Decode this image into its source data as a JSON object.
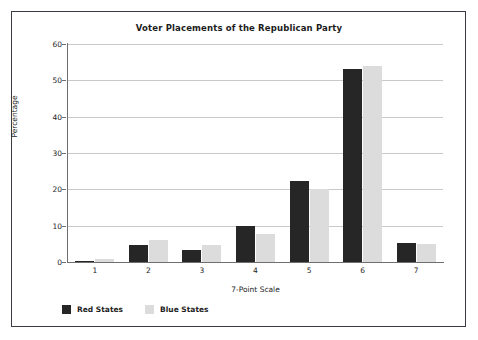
{
  "chart_data": {
    "type": "bar",
    "title": "Voter Placements of the Republican Party",
    "xlabel": "7-Point Scale",
    "ylabel": "Percentage",
    "categories": [
      "1",
      "2",
      "3",
      "4",
      "5",
      "6",
      "7"
    ],
    "series": [
      {
        "name": "Red States",
        "color": "#262626",
        "values": [
          0.3,
          4.8,
          3.3,
          9.9,
          22.3,
          53.0,
          5.2
        ]
      },
      {
        "name": "Blue States",
        "color": "#dcdcdc",
        "values": [
          0.8,
          6.0,
          4.7,
          7.8,
          20.1,
          54.0,
          5.1
        ]
      }
    ],
    "ylim": [
      0,
      60
    ],
    "yticks": [
      0,
      10,
      20,
      30,
      40,
      50,
      60
    ],
    "ytick_labels": [
      "0",
      "10",
      "20",
      "30",
      "40",
      "50",
      "60"
    ],
    "grid": "horizontal",
    "legend_position": "bottom-left"
  },
  "legend": {
    "entries": [
      {
        "label": "Red States",
        "swatch": "red-swatch-icon"
      },
      {
        "label": "Blue States",
        "swatch": "blue-swatch-icon"
      }
    ]
  },
  "colors": {
    "red_states": "#262626",
    "blue_states": "#dcdcdc",
    "gridline": "#c9c9c9",
    "axis": "#6f6f6f",
    "frame": "#3a3a42",
    "text": "#1c1c1c",
    "background": "#ffffff"
  }
}
